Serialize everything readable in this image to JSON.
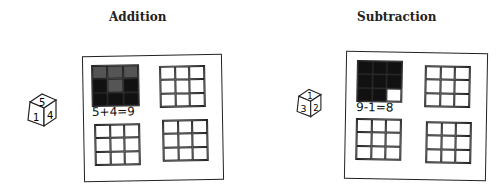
{
  "sections": [
    {
      "title": "Addition",
      "die": {
        "top": "5",
        "left": "1",
        "right": "4"
      },
      "equation": "5+4=9",
      "grids": [
        {
          "cells": [
            "shaded",
            "shaded",
            "shaded",
            "filled",
            "shaded",
            "filled",
            "filled",
            "filled",
            "filled"
          ]
        },
        {
          "cells": [
            "empty",
            "empty",
            "empty",
            "empty",
            "empty",
            "empty",
            "empty",
            "empty",
            "empty"
          ]
        },
        {
          "cells": [
            "empty",
            "empty",
            "empty",
            "empty",
            "empty",
            "empty",
            "empty",
            "empty",
            "empty"
          ]
        },
        {
          "cells": [
            "empty",
            "empty",
            "empty",
            "empty",
            "empty",
            "empty",
            "empty",
            "empty",
            "empty"
          ]
        }
      ]
    },
    {
      "title": "Subtraction",
      "die": {
        "top": "1",
        "left": "3",
        "right": "2"
      },
      "equation": "9-1=8",
      "grids": [
        {
          "cells": [
            "filled",
            "filled",
            "filled",
            "filled",
            "filled",
            "filled",
            "filled",
            "filled",
            "empty"
          ]
        },
        {
          "cells": [
            "empty",
            "empty",
            "empty",
            "empty",
            "empty",
            "empty",
            "empty",
            "empty",
            "empty"
          ]
        },
        {
          "cells": [
            "empty",
            "empty",
            "empty",
            "empty",
            "empty",
            "empty",
            "empty",
            "empty",
            "empty"
          ]
        },
        {
          "cells": [
            "empty",
            "empty",
            "empty",
            "empty",
            "empty",
            "empty",
            "empty",
            "empty",
            "empty"
          ]
        }
      ]
    }
  ]
}
